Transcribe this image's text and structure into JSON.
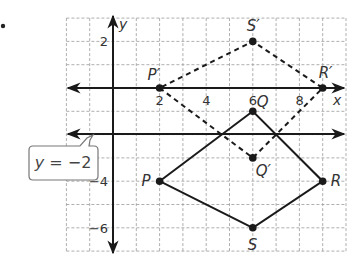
{
  "bullet": "•",
  "axes": {
    "x_label": "x",
    "y_label": "y",
    "x_ticks": [
      {
        "value": 2,
        "label": "2"
      },
      {
        "value": 4,
        "label": "4"
      },
      {
        "value": 6,
        "label": "6"
      },
      {
        "value": 8,
        "label": "8"
      }
    ],
    "y_ticks": [
      {
        "value": 2,
        "label": "2"
      },
      {
        "value": -4,
        "label": "−4"
      },
      {
        "value": -6,
        "label": "−6"
      }
    ],
    "x_range": [
      -2,
      10
    ],
    "y_range": [
      3,
      -7
    ]
  },
  "reflection_line": {
    "equation_var": "y",
    "equation_rest": " = −2",
    "y": -2
  },
  "original_quadrilateral": {
    "style": "solid",
    "vertices": [
      {
        "name": "P",
        "x": 2,
        "y": -4
      },
      {
        "name": "Q",
        "x": 6,
        "y": -1
      },
      {
        "name": "R",
        "x": 9,
        "y": -4
      },
      {
        "name": "S",
        "x": 6,
        "y": -6
      }
    ]
  },
  "image_quadrilateral": {
    "style": "dashed",
    "vertices": [
      {
        "name": "P′",
        "x": 2,
        "y": 0
      },
      {
        "name": "Q′",
        "x": 6,
        "y": -3
      },
      {
        "name": "R′",
        "x": 9,
        "y": 0
      },
      {
        "name": "S′",
        "x": 6,
        "y": 2
      }
    ]
  },
  "colors": {
    "line": "#1a1a1a",
    "grid": "#9a9a9a",
    "text": "#333333"
  }
}
